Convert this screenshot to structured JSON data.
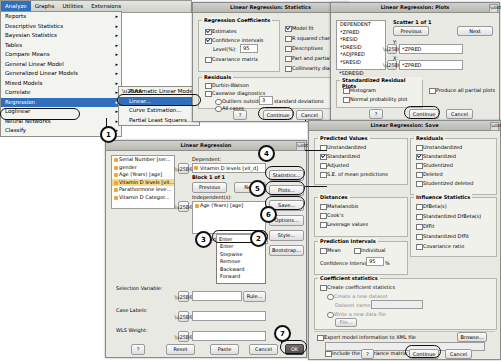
{
  "menu": {
    "bar": [
      "Analyze",
      "Graphs",
      "Utilities",
      "Extensions"
    ],
    "active": "Analyze",
    "items": [
      {
        "label": "Reports",
        "chevron": "▸"
      },
      {
        "label": "Descriptive Statistics",
        "chevron": "▸"
      },
      {
        "label": "Bayesian Statistics",
        "chevron": "▸"
      },
      {
        "label": "Tables",
        "chevron": "▸"
      },
      {
        "label": "Compare Means",
        "chevron": "▸"
      },
      {
        "label": "General Linear Model",
        "chevron": "▸"
      },
      {
        "label": "Generalized Linear Models",
        "chevron": "▸"
      },
      {
        "label": "Mixed Models",
        "chevron": "▸"
      },
      {
        "label": "Correlate",
        "chevron": "▸"
      },
      {
        "label": "Regression",
        "chevron": "▸"
      },
      {
        "label": "Loglinear",
        "chevron": "▸"
      },
      {
        "label": "Neural Networks",
        "chevron": "▸"
      },
      {
        "label": "Classify",
        "chevron": "▸"
      }
    ],
    "submenu": [
      {
        "label": "Automatic Linear Modeling..."
      },
      {
        "label": "Linear..."
      },
      {
        "label": "Curve Estimation..."
      },
      {
        "label": "Partial Least Squares..."
      }
    ]
  },
  "main": {
    "title": "Linear Regression",
    "variables": [
      "Serial Number [ser...",
      "gender",
      "Age (Years) [age]",
      "Vitamin D levels [vit...",
      "Parathormone leve...",
      "Vitamin D Categor..."
    ],
    "dependent_label": "Dependent:",
    "dependent_value": "Vitamin D levels [vit_d]",
    "block_label": "Block 1 of 1",
    "previous_label": "Previous",
    "next_label": "Next",
    "independents_label": "Independent(s):",
    "independents": [
      "Age (Years) [age]"
    ],
    "method_label": "Method:",
    "method_value": "Enter",
    "method_options": [
      "Enter",
      "Stepwise",
      "Remove",
      "Backward",
      "Forward"
    ],
    "selection_label": "Selection Variable:",
    "selection_value": "",
    "rule_label": "Rule...",
    "case_labels_label": "Case Labels:",
    "case_labels_value": "",
    "wls_label": "WLS Weight:",
    "wls_value": "",
    "side_buttons": [
      "Statistics...",
      "Plots...",
      "Save...",
      "Options...",
      "Style...",
      "Bootstrap..."
    ],
    "bottom_buttons": [
      "OK",
      "Paste",
      "Reset",
      "Cancel",
      "?"
    ]
  },
  "statistics": {
    "title": "Linear Regression: Statistics",
    "group_coefficients": "Regression Coefficients",
    "coefficients": [
      {
        "label": "Estimates",
        "checked": true
      },
      {
        "label": "Confidence intervals",
        "checked": true
      },
      {
        "label": "Level(%):",
        "checked": false,
        "value": "95"
      },
      {
        "label": "Covariance matrix",
        "checked": false
      }
    ],
    "right_options": [
      {
        "label": "Model fit",
        "checked": true
      },
      {
        "label": "R squared change",
        "checked": false
      },
      {
        "label": "Descriptives",
        "checked": false
      },
      {
        "label": "Part and partial correlations",
        "checked": false
      },
      {
        "label": "Collinearity diagnostics",
        "checked": false
      }
    ],
    "group_residuals": "Residuals",
    "residuals": [
      {
        "label": "Durbin-Watson",
        "checked": false
      },
      {
        "label": "Casewise diagnostics",
        "checked": false
      },
      {
        "label": "Outliers outside:",
        "checked": false,
        "value": "3",
        "suffix": "standard deviations"
      },
      {
        "label": "All cases",
        "checked": false
      }
    ],
    "buttons": [
      "Continue",
      "Cancel",
      "?"
    ]
  },
  "plots": {
    "title": "Linear Regression: Plots",
    "dependent_label": "DEPENDENT",
    "scatter_label": "Scatter 1 of 1",
    "previous_label": "Previous",
    "next_label": "Next",
    "y_label": "Y:",
    "y_value": "*ZPRED",
    "x_label": "X:",
    "x_value": "*ZPRED",
    "source_vars": [
      "*ZPRED",
      "*RESID",
      "*DRESID",
      "*ADJPRED",
      "*SRESID",
      "*SDRESID"
    ],
    "group_residual_plots": "Standardized Residual Plots",
    "residual_plots": [
      {
        "label": "Histogram",
        "checked": false
      },
      {
        "label": "Normal probability plot",
        "checked": false
      }
    ],
    "produce_all": {
      "label": "Produce all partial plots",
      "checked": false
    },
    "buttons": [
      "Continue",
      "Cancel",
      "?"
    ]
  },
  "save": {
    "title": "Linear Regression: Save",
    "group_predicted": "Predicted Values",
    "predicted": [
      {
        "label": "Unstandardized",
        "checked": false
      },
      {
        "label": "Standardized",
        "checked": false
      },
      {
        "label": "Adjusted",
        "checked": false
      },
      {
        "label": "S.E. of mean predictions",
        "checked": false
      }
    ],
    "group_residuals": "Residuals",
    "residuals": [
      {
        "label": "Unstandardized",
        "checked": false
      },
      {
        "label": "Standardized",
        "checked": false
      },
      {
        "label": "Studentized",
        "checked": false
      },
      {
        "label": "Deleted",
        "checked": false
      },
      {
        "label": "Studentized deleted",
        "checked": false
      }
    ],
    "group_distances": "Distances",
    "distances": [
      {
        "label": "Mahalanobis",
        "checked": false
      },
      {
        "label": "Cook's",
        "checked": false
      },
      {
        "label": "Leverage values",
        "checked": false
      }
    ],
    "group_influence": "Influence Statistics",
    "influence": [
      {
        "label": "DfBeta(s)",
        "checked": false
      },
      {
        "label": "Standardized DfBeta(s)",
        "checked": false
      },
      {
        "label": "DfFit",
        "checked": false
      },
      {
        "label": "Standardized DfFit",
        "checked": false
      },
      {
        "label": "Covariance ratio",
        "checked": false
      }
    ],
    "group_prediction": "Prediction Intervals",
    "prediction": [
      {
        "label": "Mean",
        "checked": false
      },
      {
        "label": "Individual",
        "checked": false
      }
    ],
    "confidence_label": "Confidence Interval:",
    "confidence_value": "95",
    "confidence_suffix": "%",
    "group_coefficient_stats": "Coefficient statistics",
    "coefficient_stats": [
      {
        "label": "Create coefficient statistics",
        "checked": false
      },
      {
        "label": "Create a new dataset",
        "checked": false
      },
      {
        "label": "Write a new data file",
        "checked": false
      }
    ],
    "dataset_name_label": "Dataset name:",
    "file_button": "File...",
    "export_label": "Export model information to XML file",
    "browse_button": "Browse...",
    "include_cov": {
      "label": "Include the covariance matrix",
      "checked": false
    },
    "buttons": [
      "Continue",
      "Cancel",
      "?"
    ]
  },
  "callouts": [
    {
      "n": "1"
    },
    {
      "n": "2"
    },
    {
      "n": "3"
    },
    {
      "n": "4"
    },
    {
      "n": "5"
    },
    {
      "n": "6"
    },
    {
      "n": "7"
    }
  ]
}
